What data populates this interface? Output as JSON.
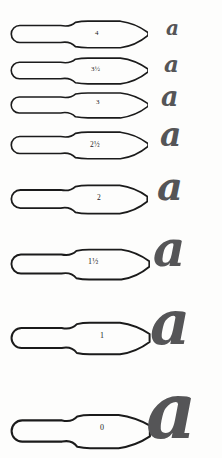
{
  "chart": {
    "glyph_character": "a",
    "ink_color": "#1b1b1b",
    "glyph_color": "#555557",
    "background_color": "#fdfdfc"
  },
  "rows": [
    {
      "size_label": "4",
      "nib": {
        "x": 10,
        "y": 18,
        "width": 138,
        "height": 32,
        "tip": "fine-point"
      },
      "label": {
        "x": 95,
        "y": 30,
        "font_size": 7
      },
      "glyph": {
        "x": 166,
        "y": 18,
        "font_size": 20
      }
    },
    {
      "size_label": "3½",
      "nib": {
        "x": 10,
        "y": 55,
        "width": 138,
        "height": 31,
        "tip": "fine-point"
      },
      "label": {
        "x": 91,
        "y": 66,
        "font_size": 7
      },
      "glyph": {
        "x": 164,
        "y": 52,
        "font_size": 23
      }
    },
    {
      "size_label": "3",
      "nib": {
        "x": 10,
        "y": 90,
        "width": 138,
        "height": 30,
        "tip": "fine-point"
      },
      "label": {
        "x": 96,
        "y": 99,
        "font_size": 7
      },
      "glyph": {
        "x": 161,
        "y": 83,
        "font_size": 27
      }
    },
    {
      "size_label": "2½",
      "nib": {
        "x": 10,
        "y": 129,
        "width": 138,
        "height": 32,
        "tip": "fine-point"
      },
      "label": {
        "x": 90,
        "y": 141,
        "font_size": 7.5
      },
      "glyph": {
        "x": 160,
        "y": 118,
        "font_size": 33
      }
    },
    {
      "size_label": "2",
      "nib": {
        "x": 10,
        "y": 182,
        "width": 138,
        "height": 34,
        "tip": "medium-point"
      },
      "label": {
        "x": 97,
        "y": 194,
        "font_size": 7.5
      },
      "glyph": {
        "x": 157,
        "y": 166,
        "font_size": 40
      }
    },
    {
      "size_label": "1½",
      "nib": {
        "x": 10,
        "y": 246,
        "width": 140,
        "height": 36,
        "tip": "medium-point"
      },
      "label": {
        "x": 88,
        "y": 258,
        "font_size": 8
      },
      "glyph": {
        "x": 153,
        "y": 224,
        "font_size": 50
      }
    },
    {
      "size_label": "1",
      "nib": {
        "x": 10,
        "y": 319,
        "width": 141,
        "height": 38,
        "tip": "broad-point"
      },
      "label": {
        "x": 100,
        "y": 332,
        "font_size": 8
      },
      "glyph": {
        "x": 150,
        "y": 292,
        "font_size": 62
      }
    },
    {
      "size_label": "0",
      "nib": {
        "x": 10,
        "y": 411,
        "width": 142,
        "height": 40,
        "tip": "broad-blunt"
      },
      "label": {
        "x": 100,
        "y": 424,
        "font_size": 8
      },
      "glyph": {
        "x": 146,
        "y": 372,
        "font_size": 78
      }
    }
  ]
}
